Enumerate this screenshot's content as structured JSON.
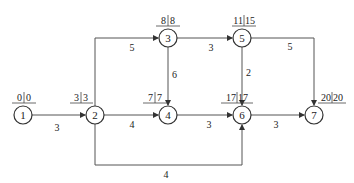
{
  "diagram": {
    "type": "activity-on-arrow network (critical path)",
    "nodes": [
      {
        "id": "1",
        "x": 23,
        "y": 115,
        "early": "0",
        "late": "0"
      },
      {
        "id": "2",
        "x": 95,
        "y": 115,
        "early": "3",
        "late": "3"
      },
      {
        "id": "3",
        "x": 168,
        "y": 38,
        "early": "8",
        "late": "8"
      },
      {
        "id": "4",
        "x": 168,
        "y": 115,
        "early": "7",
        "late": "7"
      },
      {
        "id": "5",
        "x": 242,
        "y": 38,
        "early": "11",
        "late": "15"
      },
      {
        "id": "6",
        "x": 242,
        "y": 115,
        "early": "17",
        "late": "17"
      },
      {
        "id": "7",
        "x": 314,
        "y": 115,
        "early": "20",
        "late": "20"
      }
    ],
    "edges": [
      {
        "from": "1",
        "to": "2",
        "duration": "3"
      },
      {
        "from": "2",
        "to": "3",
        "duration": "5"
      },
      {
        "from": "2",
        "to": "4",
        "duration": "4"
      },
      {
        "from": "2",
        "to": "6",
        "duration": "4"
      },
      {
        "from": "3",
        "to": "5",
        "duration": "3"
      },
      {
        "from": "3",
        "to": "4",
        "duration": "6"
      },
      {
        "from": "4",
        "to": "6",
        "duration": "3"
      },
      {
        "from": "5",
        "to": "6",
        "duration": "2"
      },
      {
        "from": "5",
        "to": "7",
        "duration": "5"
      },
      {
        "from": "6",
        "to": "7",
        "duration": "3"
      }
    ]
  }
}
